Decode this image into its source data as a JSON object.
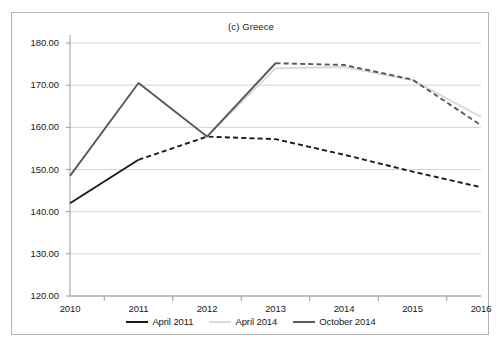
{
  "chart_data": {
    "type": "line",
    "title": "(c) Greece",
    "xlabel": "",
    "ylabel": "",
    "categories": [
      "2010",
      "2011",
      "2012",
      "2013",
      "2014",
      "2015",
      "2016"
    ],
    "x": [
      2010,
      2011,
      2012,
      2013,
      2014,
      2015,
      2016
    ],
    "xlim": [
      2010,
      2016
    ],
    "ylim": [
      120.0,
      180.0
    ],
    "yticks": [
      120.0,
      130.0,
      140.0,
      150.0,
      160.0,
      170.0,
      180.0
    ],
    "ytick_labels": [
      "120.00",
      "130.00",
      "140.00",
      "150.00",
      "160.00",
      "170.00",
      "180.00"
    ],
    "grid": "horizontal",
    "legend_position": "bottom",
    "series": [
      {
        "name": "April 2011",
        "color": "#1a1a1a",
        "style": "solid-then-dashed",
        "solid_until": 2011,
        "x": [
          2010,
          2011,
          2012,
          2013,
          2014,
          2015,
          2016
        ],
        "values": [
          142.0,
          152.3,
          157.8,
          157.2,
          153.5,
          149.5,
          145.8
        ]
      },
      {
        "name": "April 2014",
        "color": "#d9d9d9",
        "style": "solid",
        "x": [
          2012,
          2013,
          2014,
          2015,
          2016
        ],
        "values": [
          157.8,
          174.0,
          174.3,
          171.2,
          162.5
        ]
      },
      {
        "name": "October 2014",
        "color": "#595959",
        "style": "solid-then-dashed",
        "solid_until": 2013,
        "x": [
          2010,
          2011,
          2012,
          2013,
          2014,
          2015,
          2016
        ],
        "values": [
          148.5,
          170.5,
          157.8,
          175.2,
          174.8,
          171.3,
          160.5
        ]
      }
    ]
  },
  "legend": {
    "items": [
      {
        "label": "April 2011",
        "color": "#1a1a1a"
      },
      {
        "label": "April 2014",
        "color": "#d9d9d9"
      },
      {
        "label": "October 2014",
        "color": "#595959"
      }
    ]
  }
}
